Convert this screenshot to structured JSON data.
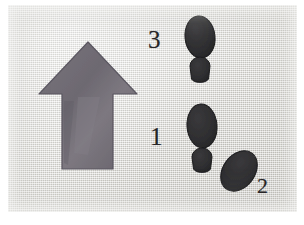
{
  "figure": {
    "media": "photograph-of-drawing-on-textured-paper",
    "background_color": "#dcdbd6",
    "border_color": "#ffffff"
  },
  "direction_arrow": {
    "name": "direction-of-travel-arrow",
    "points": "up",
    "fill_color": "#6e6a72",
    "outline_color": "#56525a",
    "apex": [
      88,
      42
    ],
    "head_base_y": 97,
    "head_left_x": 40,
    "head_right_x": 137,
    "shaft_left_x": 62,
    "shaft_right_x": 113,
    "shaft_bottom_y": 172
  },
  "footprints": {
    "fill_color": "#2e2e30",
    "outline_color": "#1c1c1e",
    "items": [
      {
        "label": "3",
        "name": "footprint-3",
        "side": "upper",
        "sole": {
          "cx": 200,
          "cy": 37,
          "rx": 15,
          "ry": 21,
          "rotation": -6
        },
        "heel": {
          "cx": 200,
          "cy": 71,
          "rx": 10,
          "ry": 9,
          "rotation": 0
        }
      },
      {
        "label": "1",
        "name": "footprint-1",
        "side": "middle",
        "sole": {
          "cx": 202,
          "cy": 126,
          "rx": 15,
          "ry": 22,
          "rotation": -4
        },
        "heel": {
          "cx": 202,
          "cy": 164,
          "rx": 10,
          "ry": 9,
          "rotation": 0
        }
      },
      {
        "label": "2",
        "name": "footprint-2",
        "side": "lower-right",
        "sole": {
          "cx": 239,
          "cy": 171,
          "rx": 16,
          "ry": 22,
          "rotation": 36
        },
        "heel": null
      }
    ]
  },
  "labels": {
    "three": "3",
    "one": "1",
    "two": "2"
  }
}
